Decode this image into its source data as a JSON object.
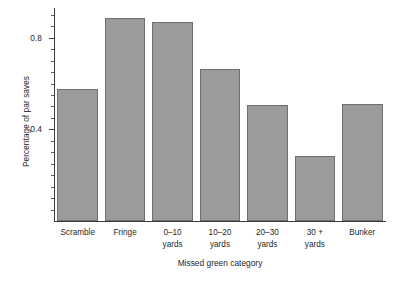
{
  "chart_data": {
    "type": "bar",
    "title": "",
    "xlabel": "Missed green category",
    "ylabel": "Percentage of par saves",
    "categories": [
      "Scramble",
      "Fringe",
      "0–10 yards",
      "10–20 yards",
      "20–30 yards",
      "30 + yards",
      "Bunker"
    ],
    "category_lines": [
      [
        "Scramble"
      ],
      [
        "Fringe"
      ],
      [
        "0–10",
        "yards"
      ],
      [
        "10–20",
        "yards"
      ],
      [
        "20–30",
        "yards"
      ],
      [
        "30 +",
        "yards"
      ],
      [
        "Bunker"
      ]
    ],
    "values": [
      0.575,
      0.885,
      0.87,
      0.665,
      0.505,
      0.285,
      0.51
    ],
    "ylim": [
      0.0,
      0.93
    ],
    "ytick_values": [
      0.4,
      0.8
    ],
    "ytick_labels": [
      "0.4",
      "0.8"
    ],
    "yminor_step": 0.05,
    "grid": false,
    "legend": false,
    "bar_color": "#9b9b9b",
    "bar_edge_color": "#6f6f6f",
    "axis_color": "#3d3d3d"
  }
}
